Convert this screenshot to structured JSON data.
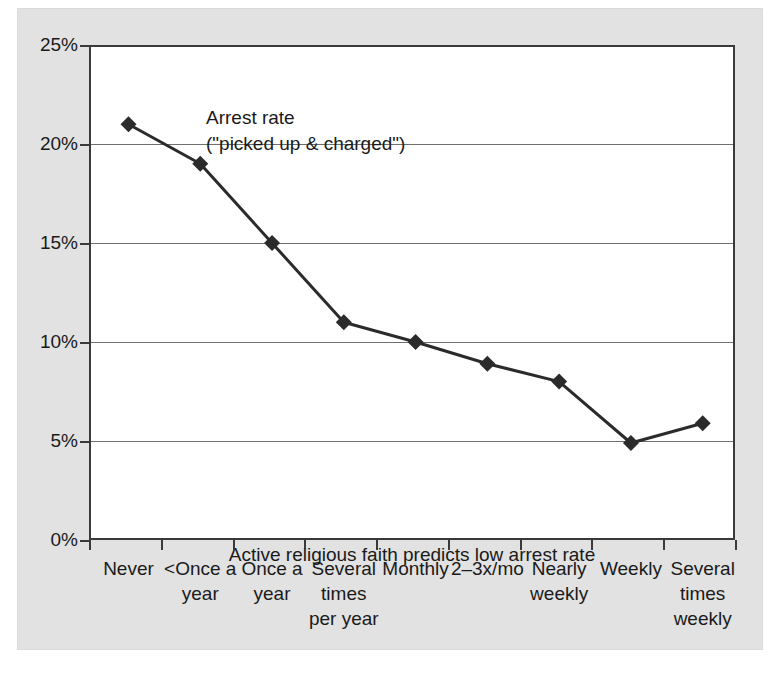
{
  "chart_data": {
    "type": "line",
    "title": "",
    "subtitle": "",
    "xlabel": "",
    "ylabel": "Arrest rate (\"picked up & charged\")",
    "categories": [
      "Never",
      "<Once a\nyear",
      "Once a\nyear",
      "Several\ntimes\nper year",
      "Monthly",
      "2–3x/mo",
      "Nearly\nweekly",
      "Weekly",
      "Several\ntimes\nweekly"
    ],
    "values": [
      21.0,
      19.0,
      15.0,
      11.0,
      10.0,
      8.9,
      8.0,
      4.9,
      5.9
    ],
    "ylim": [
      0,
      25
    ],
    "yticks": [
      0,
      5,
      10,
      15,
      20,
      25
    ],
    "ytick_labels": [
      "0%",
      "5%",
      "10%",
      "15%",
      "20%",
      "25%"
    ],
    "grid": "horizontal",
    "legend": "none",
    "annotations": [
      "Arrest rate\n(\"picked up & charged\")",
      "Active religious faith predicts low arrest rate"
    ],
    "marker": "diamond",
    "series_color": "#2b2b2b"
  },
  "annotations": {
    "series_label": "Arrest rate\n(\"picked up & charged\")",
    "caption": "Active religious faith predicts low arrest rate"
  },
  "colors": {
    "panel_background": "#e2e2e2",
    "plot_background": "#ffffff",
    "axis": "#3a3a3a",
    "gridline": "#6f6f6f",
    "series": "#2b2b2b",
    "text": "#1a1a1a"
  }
}
